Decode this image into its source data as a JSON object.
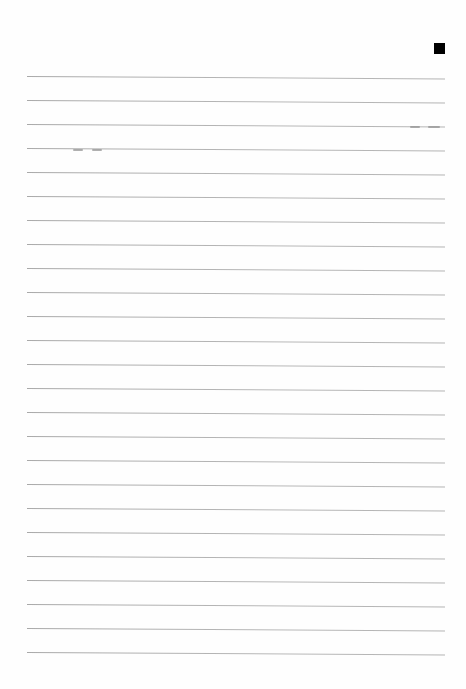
{
  "page": {
    "type": "lined notebook page (blank)",
    "background": "#fefefe",
    "rule_color": "#b0b0b0",
    "marker": {
      "shape": "filled-square",
      "color": "#000000"
    },
    "rules": {
      "count": 25,
      "first_y": 76,
      "spacing": 24,
      "left_x": 27,
      "right_x": 445
    },
    "text": ""
  }
}
